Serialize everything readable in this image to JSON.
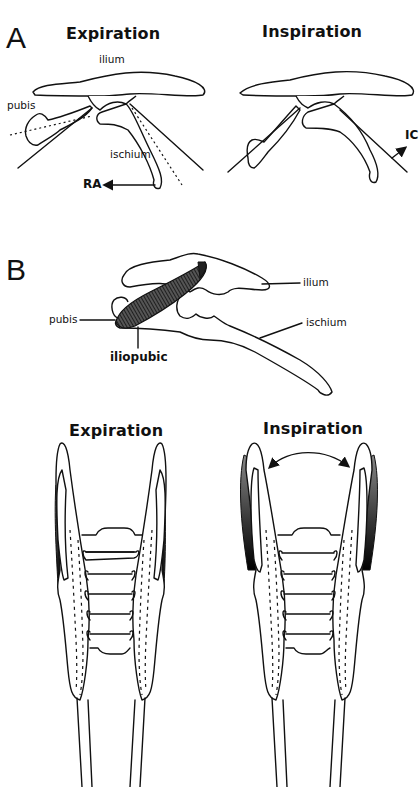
{
  "panel_a": {
    "letter": "A",
    "expiration": {
      "title": "Expiration",
      "labels": {
        "ilium": "ilium",
        "pubis": "pubis",
        "ischium": "ischium",
        "arrow": "RA"
      }
    },
    "inspiration": {
      "title": "Inspiration",
      "labels": {
        "arrow": "IC"
      }
    }
  },
  "panel_b": {
    "letter": "B",
    "lateral_labels": {
      "ilium": "ilium",
      "pubis": "pubis",
      "ischium": "ischium",
      "muscle": "iliopubic"
    },
    "expiration_title": "Expiration",
    "inspiration_title": "Inspiration"
  }
}
